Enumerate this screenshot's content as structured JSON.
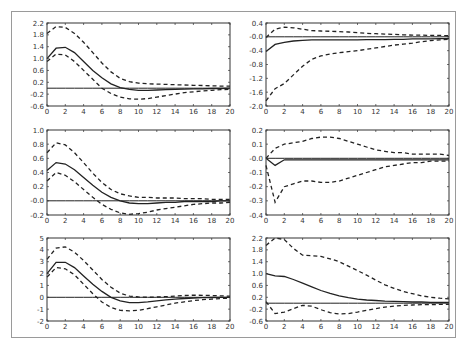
{
  "chart_data": [
    {
      "type": "line",
      "panel": "row1-left",
      "x": [
        0,
        1,
        2,
        3,
        4,
        5,
        6,
        7,
        8,
        9,
        10,
        11,
        12,
        13,
        14,
        15,
        16,
        17,
        18,
        19,
        20
      ],
      "ylim": [
        -0.6,
        2.2
      ],
      "yticks": [
        "2.2",
        "1.8",
        "1.4",
        "1.0",
        "0.6",
        "0.2",
        "-0.2",
        "-0.6"
      ],
      "xticks": [
        "0",
        "2",
        "4",
        "6",
        "8",
        "10",
        "12",
        "14",
        "16",
        "18",
        "20"
      ],
      "series": [
        {
          "name": "response",
          "style": "solid",
          "values": [
            1.0,
            1.35,
            1.38,
            1.2,
            0.9,
            0.6,
            0.35,
            0.15,
            0.02,
            -0.04,
            -0.07,
            -0.07,
            -0.06,
            -0.05,
            -0.04,
            -0.03,
            -0.02,
            -0.02,
            -0.01,
            -0.01,
            0.0
          ]
        },
        {
          "name": "upper",
          "style": "dashed",
          "values": [
            1.85,
            2.08,
            2.05,
            1.85,
            1.55,
            1.2,
            0.85,
            0.55,
            0.33,
            0.22,
            0.17,
            0.15,
            0.14,
            0.13,
            0.12,
            0.11,
            0.1,
            0.09,
            0.08,
            0.07,
            0.07
          ]
        },
        {
          "name": "lower",
          "style": "dashed",
          "values": [
            0.9,
            1.15,
            1.12,
            0.9,
            0.6,
            0.3,
            0.0,
            -0.18,
            -0.3,
            -0.36,
            -0.37,
            -0.35,
            -0.3,
            -0.25,
            -0.2,
            -0.15,
            -0.12,
            -0.09,
            -0.07,
            -0.05,
            -0.04
          ]
        },
        {
          "name": "zero",
          "style": "solid",
          "values": [
            0,
            0,
            0,
            0,
            0,
            0,
            0,
            0,
            0,
            0,
            0,
            0,
            0,
            0,
            0,
            0,
            0,
            0,
            0,
            0,
            0
          ]
        }
      ]
    },
    {
      "type": "line",
      "panel": "row1-right",
      "x": [
        0,
        1,
        2,
        3,
        4,
        5,
        6,
        7,
        8,
        9,
        10,
        11,
        12,
        13,
        14,
        15,
        16,
        17,
        18,
        19,
        20
      ],
      "ylim": [
        -2.0,
        0.4
      ],
      "yticks": [
        "0.4",
        "-0.0",
        "-0.4",
        "-0.8",
        "-1.2",
        "-1.6",
        "-2.0"
      ],
      "xticks": [
        "0",
        "2",
        "4",
        "6",
        "8",
        "10",
        "12",
        "14",
        "16",
        "18",
        "20"
      ],
      "series": [
        {
          "name": "response",
          "style": "solid",
          "values": [
            -0.42,
            -0.22,
            -0.16,
            -0.12,
            -0.1,
            -0.09,
            -0.09,
            -0.09,
            -0.09,
            -0.09,
            -0.09,
            -0.08,
            -0.08,
            -0.08,
            -0.07,
            -0.07,
            -0.06,
            -0.06,
            -0.06,
            -0.05,
            -0.05
          ]
        },
        {
          "name": "upper",
          "style": "dashed",
          "values": [
            -0.02,
            0.22,
            0.28,
            0.26,
            0.22,
            0.18,
            0.17,
            0.16,
            0.15,
            0.14,
            0.12,
            0.1,
            0.09,
            0.08,
            0.07,
            0.06,
            0.05,
            0.05,
            0.04,
            0.04,
            0.03
          ]
        },
        {
          "name": "lower",
          "style": "dashed",
          "values": [
            -1.85,
            -1.5,
            -1.35,
            -1.1,
            -0.85,
            -0.65,
            -0.55,
            -0.5,
            -0.46,
            -0.43,
            -0.4,
            -0.36,
            -0.32,
            -0.28,
            -0.24,
            -0.21,
            -0.18,
            -0.14,
            -0.11,
            -0.09,
            -0.07
          ]
        },
        {
          "name": "zero",
          "style": "solid",
          "values": [
            0,
            0,
            0,
            0,
            0,
            0,
            0,
            0,
            0,
            0,
            0,
            0,
            0,
            0,
            0,
            0,
            0,
            0,
            0,
            0,
            0
          ]
        }
      ]
    },
    {
      "type": "line",
      "panel": "row2-left",
      "x": [
        0,
        1,
        2,
        3,
        4,
        5,
        6,
        7,
        8,
        9,
        10,
        11,
        12,
        13,
        14,
        15,
        16,
        17,
        18,
        19,
        20
      ],
      "ylim": [
        -0.2,
        1.0
      ],
      "yticks": [
        "1.0",
        "0.8",
        "0.6",
        "0.4",
        "0.2",
        "-0.0",
        "-0.2"
      ],
      "xticks": [
        "0",
        "2",
        "4",
        "6",
        "8",
        "10",
        "12",
        "14",
        "16",
        "18",
        "20"
      ],
      "series": [
        {
          "name": "response",
          "style": "solid",
          "values": [
            0.43,
            0.54,
            0.52,
            0.44,
            0.33,
            0.22,
            0.12,
            0.05,
            0.0,
            -0.03,
            -0.04,
            -0.04,
            -0.03,
            -0.02,
            -0.02,
            -0.01,
            -0.01,
            -0.01,
            -0.01,
            0.0,
            0.0
          ]
        },
        {
          "name": "upper",
          "style": "dashed",
          "values": [
            0.68,
            0.82,
            0.79,
            0.68,
            0.54,
            0.39,
            0.26,
            0.16,
            0.1,
            0.07,
            0.05,
            0.05,
            0.04,
            0.04,
            0.04,
            0.03,
            0.03,
            0.03,
            0.02,
            0.02,
            0.02
          ]
        },
        {
          "name": "lower",
          "style": "dashed",
          "values": [
            0.28,
            0.4,
            0.36,
            0.27,
            0.16,
            0.05,
            -0.05,
            -0.12,
            -0.17,
            -0.19,
            -0.18,
            -0.16,
            -0.13,
            -0.11,
            -0.09,
            -0.07,
            -0.05,
            -0.04,
            -0.03,
            -0.03,
            -0.02
          ]
        },
        {
          "name": "zero",
          "style": "solid",
          "values": [
            0,
            0,
            0,
            0,
            0,
            0,
            0,
            0,
            0,
            0,
            0,
            0,
            0,
            0,
            0,
            0,
            0,
            0,
            0,
            0,
            0
          ]
        }
      ]
    },
    {
      "type": "line",
      "panel": "row2-right",
      "x": [
        0,
        1,
        2,
        3,
        4,
        5,
        6,
        7,
        8,
        9,
        10,
        11,
        12,
        13,
        14,
        15,
        16,
        17,
        18,
        19,
        20
      ],
      "ylim": [
        -0.4,
        0.2
      ],
      "yticks": [
        "0.2",
        "0.1",
        "-0.0",
        "-0.1",
        "-0.2",
        "-0.3",
        "-0.4"
      ],
      "xticks": [
        "0",
        "2",
        "4",
        "6",
        "8",
        "10",
        "12",
        "14",
        "16",
        "18",
        "20"
      ],
      "series": [
        {
          "name": "response",
          "style": "solid",
          "values": [
            0.0,
            -0.05,
            -0.01,
            -0.01,
            -0.01,
            -0.01,
            -0.01,
            -0.01,
            -0.01,
            -0.01,
            -0.01,
            -0.01,
            -0.01,
            -0.01,
            -0.01,
            -0.01,
            -0.01,
            -0.01,
            -0.01,
            -0.01,
            -0.01
          ]
        },
        {
          "name": "upper",
          "style": "dashed",
          "values": [
            0.0,
            0.07,
            0.1,
            0.11,
            0.12,
            0.14,
            0.15,
            0.15,
            0.14,
            0.12,
            0.1,
            0.08,
            0.06,
            0.05,
            0.04,
            0.04,
            0.03,
            0.03,
            0.03,
            0.03,
            0.02
          ]
        },
        {
          "name": "lower",
          "style": "dashed",
          "values": [
            -0.05,
            -0.31,
            -0.2,
            -0.18,
            -0.16,
            -0.16,
            -0.17,
            -0.17,
            -0.16,
            -0.14,
            -0.12,
            -0.1,
            -0.08,
            -0.06,
            -0.05,
            -0.04,
            -0.03,
            -0.03,
            -0.02,
            -0.02,
            -0.02
          ]
        },
        {
          "name": "zero",
          "style": "solid",
          "values": [
            0,
            0,
            0,
            0,
            0,
            0,
            0,
            0,
            0,
            0,
            0,
            0,
            0,
            0,
            0,
            0,
            0,
            0,
            0,
            0,
            0
          ]
        }
      ]
    },
    {
      "type": "line",
      "panel": "row3-left",
      "x": [
        0,
        1,
        2,
        3,
        4,
        5,
        6,
        7,
        8,
        9,
        10,
        11,
        12,
        13,
        14,
        15,
        16,
        17,
        18,
        19,
        20
      ],
      "ylim": [
        -2,
        5
      ],
      "yticks": [
        "5",
        "4",
        "3",
        "2",
        "1",
        "0",
        "-1",
        "-2"
      ],
      "xticks": [
        "0",
        "2",
        "4",
        "6",
        "8",
        "10",
        "12",
        "14",
        "16",
        "18",
        "20"
      ],
      "series": [
        {
          "name": "response",
          "style": "solid",
          "values": [
            2.0,
            2.95,
            2.95,
            2.5,
            1.8,
            1.1,
            0.5,
            0.0,
            -0.3,
            -0.45,
            -0.45,
            -0.38,
            -0.3,
            -0.22,
            -0.15,
            -0.1,
            -0.06,
            -0.03,
            -0.02,
            -0.01,
            0.0
          ]
        },
        {
          "name": "upper",
          "style": "dashed",
          "values": [
            3.2,
            4.15,
            4.25,
            3.8,
            3.1,
            2.3,
            1.5,
            0.85,
            0.35,
            0.1,
            0.02,
            0.0,
            0.02,
            0.05,
            0.1,
            0.15,
            0.18,
            0.17,
            0.15,
            0.12,
            0.1
          ]
        },
        {
          "name": "lower",
          "style": "dashed",
          "values": [
            1.7,
            2.5,
            2.4,
            1.9,
            1.1,
            0.3,
            -0.4,
            -0.85,
            -1.1,
            -1.15,
            -1.1,
            -0.95,
            -0.8,
            -0.65,
            -0.5,
            -0.38,
            -0.28,
            -0.2,
            -0.15,
            -0.1,
            -0.08
          ]
        },
        {
          "name": "zero",
          "style": "solid",
          "values": [
            0,
            0,
            0,
            0,
            0,
            0,
            0,
            0,
            0,
            0,
            0,
            0,
            0,
            0,
            0,
            0,
            0,
            0,
            0,
            0,
            0
          ]
        }
      ]
    },
    {
      "type": "line",
      "panel": "row3-right",
      "x": [
        0,
        1,
        2,
        3,
        4,
        5,
        6,
        7,
        8,
        9,
        10,
        11,
        12,
        13,
        14,
        15,
        16,
        17,
        18,
        19,
        20
      ],
      "ylim": [
        -0.6,
        2.2
      ],
      "yticks": [
        "2.2",
        "1.8",
        "1.4",
        "1.0",
        "0.6",
        "0.2",
        "-0.2",
        "-0.6"
      ],
      "xticks": [
        "0",
        "2",
        "4",
        "6",
        "8",
        "10",
        "12",
        "14",
        "16",
        "18",
        "20"
      ],
      "series": [
        {
          "name": "response",
          "style": "solid",
          "values": [
            1.0,
            0.92,
            0.9,
            0.8,
            0.68,
            0.55,
            0.43,
            0.33,
            0.25,
            0.19,
            0.14,
            0.11,
            0.09,
            0.07,
            0.06,
            0.05,
            0.04,
            0.04,
            0.03,
            0.03,
            0.03
          ]
        },
        {
          "name": "upper",
          "style": "dashed",
          "values": [
            1.95,
            2.2,
            2.15,
            1.85,
            1.62,
            1.6,
            1.58,
            1.5,
            1.4,
            1.25,
            1.1,
            0.95,
            0.78,
            0.62,
            0.5,
            0.4,
            0.32,
            0.25,
            0.2,
            0.17,
            0.15
          ]
        },
        {
          "name": "lower",
          "style": "dashed",
          "values": [
            0.05,
            -0.35,
            -0.3,
            -0.18,
            -0.07,
            -0.1,
            -0.22,
            -0.32,
            -0.36,
            -0.35,
            -0.3,
            -0.24,
            -0.18,
            -0.13,
            -0.1,
            -0.07,
            -0.06,
            -0.05,
            -0.05,
            -0.04,
            -0.04
          ]
        },
        {
          "name": "zero",
          "style": "solid",
          "values": [
            0,
            0,
            0,
            0,
            0,
            0,
            0,
            0,
            0,
            0,
            0,
            0,
            0,
            0,
            0,
            0,
            0,
            0,
            0,
            0,
            0
          ]
        }
      ]
    }
  ],
  "layout": {
    "panels": [
      {
        "x": 47,
        "y": 23,
        "w": 183,
        "h": 83
      },
      {
        "x": 266,
        "y": 23,
        "w": 183,
        "h": 83
      },
      {
        "x": 47,
        "y": 130,
        "w": 183,
        "h": 85
      },
      {
        "x": 266,
        "y": 130,
        "w": 183,
        "h": 85
      },
      {
        "x": 47,
        "y": 238,
        "w": 183,
        "h": 83
      },
      {
        "x": 266,
        "y": 238,
        "w": 183,
        "h": 83
      }
    ]
  }
}
